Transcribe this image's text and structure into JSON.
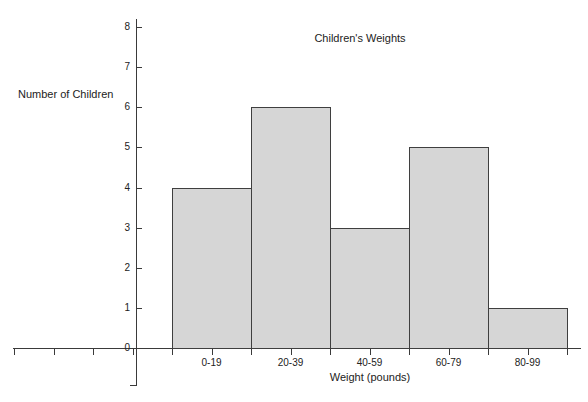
{
  "chart_data": {
    "type": "bar",
    "title": "Children's Weights",
    "xlabel": "Weight (pounds)",
    "ylabel": "Number of Children",
    "categories": [
      "0-19",
      "20-39",
      "40-59",
      "60-79",
      "80-99"
    ],
    "values": [
      4,
      6,
      3,
      5,
      1
    ],
    "ylim": [
      0,
      8
    ],
    "yticks": [
      0,
      1,
      2,
      3,
      4,
      5,
      6,
      7,
      8
    ],
    "ytick_labels": [
      "0",
      "1",
      "2",
      "3",
      "4",
      "5",
      "6",
      "7",
      "8"
    ],
    "grid": false,
    "legend": false,
    "bar_fill_color": "#d6d6d6",
    "bar_edge_color": "#3f3f3f",
    "axis_color": "#3a3a3a",
    "background_color": "#ffffff",
    "style": "histogram-adjacent-bars"
  }
}
